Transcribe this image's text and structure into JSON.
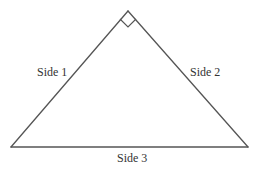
{
  "diagram": {
    "type": "right-triangle",
    "colors": {
      "stroke": "#555555",
      "text": "#333333",
      "background": "#ffffff"
    },
    "vertices": {
      "apex": [
        128,
        11
      ],
      "bottom_left": [
        11,
        147
      ],
      "bottom_right": [
        248,
        147
      ]
    },
    "right_angle_marker": {
      "at": "apex",
      "points": [
        [
          120,
          19
        ],
        [
          128,
          27
        ],
        [
          136,
          19
        ]
      ]
    },
    "labels": {
      "side1": "Side 1",
      "side2": "Side 2",
      "side3": "Side 3"
    }
  }
}
